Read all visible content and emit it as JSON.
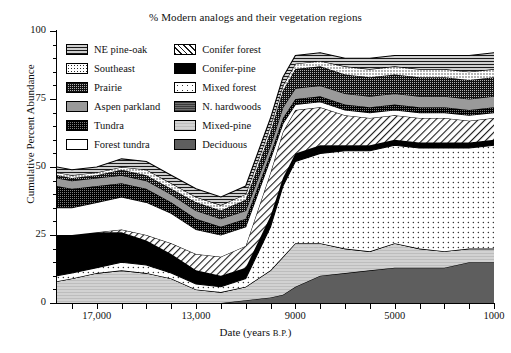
{
  "chart_data": {
    "type": "area",
    "stacked": true,
    "title": "% Modern analogs and their vegetation regions",
    "xlabel": "Date (years B.P.)",
    "xlabel_main": "Date (years",
    "xlabel_sub": "B.P.",
    "ylabel": "Cumulative Percent Abundance",
    "ylim": [
      0,
      100
    ],
    "yticks": [
      0,
      25,
      50,
      75,
      100
    ],
    "ytick_labels": [
      "0",
      "25",
      "50",
      "75",
      "100"
    ],
    "xlim": [
      18600,
      1000
    ],
    "x_reversed": true,
    "xticks": [
      17000,
      13000,
      9000,
      5000,
      1000
    ],
    "xtick_labels": [
      "17,000",
      "13,000",
      "9000",
      "5000",
      "1000"
    ],
    "x_minor_tick_interval": 1000,
    "grid": false,
    "legend_position": "upper-left-inside",
    "x": [
      18600,
      18000,
      17000,
      16000,
      15000,
      14000,
      13000,
      12000,
      11000,
      10000,
      9500,
      9000,
      8000,
      7000,
      6000,
      5000,
      4000,
      3000,
      2000,
      1000
    ],
    "series": [
      {
        "name": "Deciduous",
        "pattern": "solid-dark-gray",
        "color": "#5e5e5e",
        "values": [
          0,
          0,
          0,
          0,
          0,
          0,
          0,
          0,
          1,
          2,
          3,
          6,
          10,
          11,
          12,
          13,
          13,
          13,
          15,
          15
        ]
      },
      {
        "name": "Mixed-pine",
        "pattern": "light-gray",
        "color": "#d2d2d2",
        "values": [
          8,
          9,
          11,
          12,
          11,
          9,
          5,
          4,
          5,
          10,
          14,
          16,
          12,
          9,
          7,
          9,
          7,
          6,
          5,
          5
        ]
      },
      {
        "name": "N. hardwoods",
        "pattern": "dark-gray-lines",
        "color": "#6f6f6f",
        "values": [
          0,
          0,
          0,
          0,
          0,
          0,
          0,
          0,
          0,
          0,
          0,
          0,
          0,
          0,
          0,
          0,
          0,
          0,
          0,
          0
        ]
      },
      {
        "name": "Mixed forest",
        "pattern": "sparse-dots",
        "color": "#ffffff",
        "values": [
          2,
          2,
          2,
          3,
          3,
          2,
          2,
          2,
          3,
          16,
          26,
          30,
          33,
          36,
          37,
          36,
          37,
          38,
          37,
          38
        ]
      },
      {
        "name": "Conifer-pine",
        "pattern": "solid-black",
        "color": "#000000",
        "values": [
          15,
          14,
          13,
          11,
          9,
          7,
          5,
          4,
          4,
          4,
          3,
          3,
          3,
          2,
          2,
          2,
          2,
          2,
          2,
          2
        ]
      },
      {
        "name": "Conifer forest",
        "pattern": "diagonal-hatch",
        "color": "#ffffff",
        "values": [
          0,
          0,
          0,
          1,
          2,
          4,
          6,
          7,
          8,
          16,
          17,
          16,
          14,
          11,
          10,
          9,
          9,
          9,
          8,
          8
        ]
      },
      {
        "name": "Forest tundra",
        "pattern": "white",
        "color": "#ffffff",
        "values": [
          10,
          10,
          11,
          12,
          12,
          11,
          9,
          8,
          7,
          5,
          3,
          2,
          2,
          2,
          2,
          2,
          2,
          2,
          2,
          2
        ]
      },
      {
        "name": "Tundra",
        "pattern": "dark-grid",
        "color": "#7d7d7d",
        "values": [
          8,
          7,
          6,
          5,
          5,
          4,
          4,
          3,
          3,
          2,
          2,
          2,
          2,
          2,
          2,
          2,
          2,
          2,
          2,
          2
        ]
      },
      {
        "name": "Aspen parkland",
        "pattern": "solid-medium-gray",
        "color": "#9a9a9a",
        "values": [
          3,
          3,
          3,
          3,
          3,
          3,
          3,
          3,
          3,
          3,
          4,
          4,
          4,
          4,
          4,
          4,
          4,
          4,
          4,
          4
        ]
      },
      {
        "name": "Prairie",
        "pattern": "dense-grid",
        "color": "#b4b4b4",
        "values": [
          1,
          1,
          1,
          2,
          2,
          2,
          3,
          3,
          4,
          5,
          6,
          7,
          7,
          7,
          7,
          7,
          7,
          7,
          7,
          7
        ]
      },
      {
        "name": "Southeast",
        "pattern": "fine-dots",
        "color": "#ffffff",
        "values": [
          1,
          1,
          1,
          1,
          2,
          2,
          2,
          2,
          2,
          2,
          2,
          2,
          2,
          3,
          3,
          3,
          3,
          3,
          3,
          3
        ]
      },
      {
        "name": "NE pine-oak",
        "pattern": "horizontal-lines",
        "color": "#cfcfcf",
        "values": [
          2,
          2,
          2,
          3,
          3,
          3,
          3,
          3,
          3,
          3,
          3,
          3,
          3,
          3,
          4,
          4,
          5,
          5,
          6,
          6
        ]
      }
    ]
  },
  "legend": {
    "column_left": [
      {
        "label": "NE pine-oak",
        "swatch": "sw-ne-pine-oak"
      },
      {
        "label": "Southeast",
        "swatch": "sw-southeast"
      },
      {
        "label": "Prairie",
        "swatch": "sw-prairie"
      },
      {
        "label": "Aspen parkland",
        "swatch": "sw-aspen-parkland"
      },
      {
        "label": "Tundra",
        "swatch": "sw-tundra"
      },
      {
        "label": "Forest tundra",
        "swatch": "sw-forest-tundra"
      }
    ],
    "column_right": [
      {
        "label": "Conifer forest",
        "swatch": "sw-conifer-forest"
      },
      {
        "label": "Conifer-pine",
        "swatch": "sw-conifer-pine"
      },
      {
        "label": "Mixed forest",
        "swatch": "sw-mixed-forest"
      },
      {
        "label": "N. hardwoods",
        "swatch": "sw-n-hardwoods"
      },
      {
        "label": "Mixed-pine",
        "swatch": "sw-mixed-pine"
      },
      {
        "label": "Deciduous",
        "swatch": "sw-deciduous"
      }
    ]
  }
}
